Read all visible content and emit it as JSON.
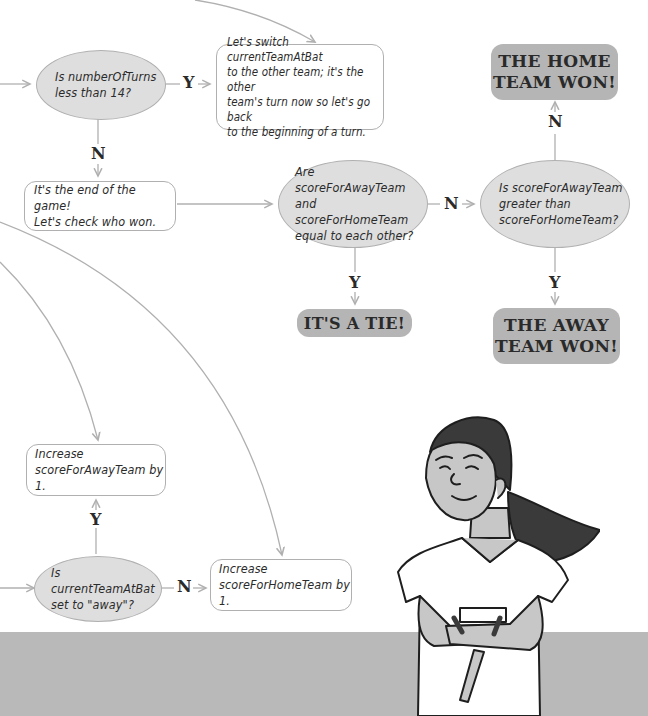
{
  "flowchart": {
    "decisions": {
      "turns_check": "Is numberOfTurns\nless than 14?",
      "tie_check": "Are scoreForAwayTeam\nand scoreForHomeTeam\nequal to each other?",
      "away_greater_check": "Is scoreForAwayTeam\ngreater than\nscoreForHomeTeam?",
      "team_at_bat_check": "Is currentTeamAtBat\nset to \"away\"?"
    },
    "actions": {
      "switch_team": "Let's switch currentTeamAtBat\nto the other team; it's the other\nteam's turn now so let's go back\nto the beginning of a turn.",
      "end_game": "It's the end of the game!\nLet's check who won.",
      "increase_away": "Increase\nscoreForAwayTeam by 1.",
      "increase_home": "Increase\nscoreForHomeTeam by 1."
    },
    "results": {
      "home_won": "THE HOME\nTEAM WON!",
      "tie": "IT'S A TIE!",
      "away_won": "THE AWAY\nTEAM WON!"
    },
    "labels": {
      "yes": "Y",
      "no": "N"
    }
  },
  "illustration": {
    "subject": "smiling girl with ponytail, arms crossed"
  },
  "colors": {
    "oval_fill": "#dedede",
    "result_fill": "#b5b5b5",
    "border": "#b0b0b0",
    "floor": "#b9b9b9"
  }
}
